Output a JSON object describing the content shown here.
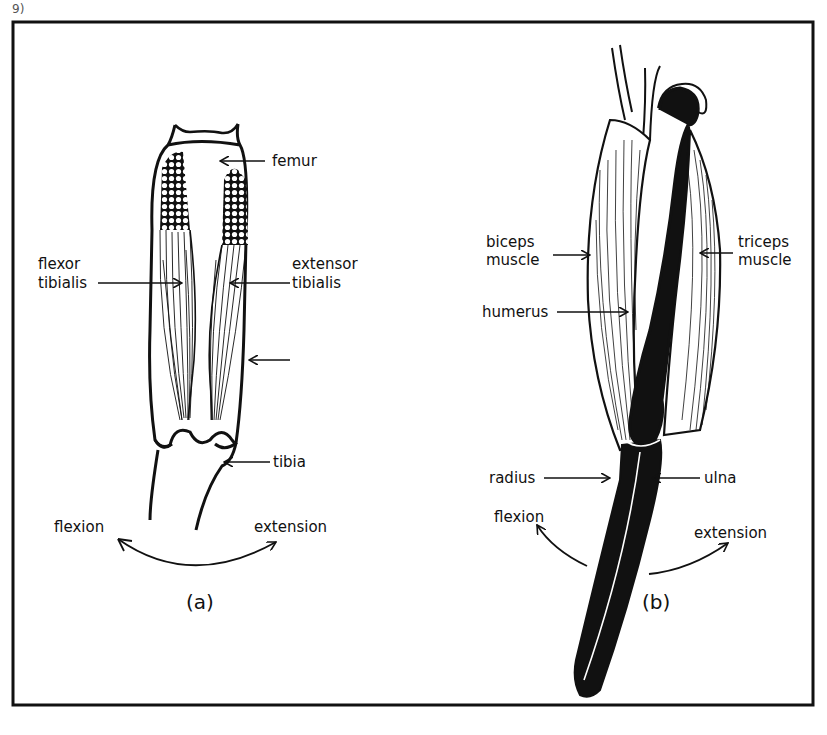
{
  "figure": {
    "corner_mark": "9)",
    "panel_a": {
      "caption": "(a)",
      "labels": {
        "femur": "femur",
        "flexor_line1": "flexor",
        "flexor_line2": "tibialis",
        "extensor_line1": "extensor",
        "extensor_line2": "tibialis",
        "tibia": "tibia",
        "flexion": "flexion",
        "extension": "extension"
      }
    },
    "panel_b": {
      "caption": "(b)",
      "labels": {
        "biceps_line1": "biceps",
        "biceps_line2": "muscle",
        "triceps_line1": "triceps",
        "triceps_line2": "muscle",
        "humerus": "humerus",
        "radius": "radius",
        "ulna": "ulna",
        "flexion": "flexion",
        "extension": "extension"
      }
    },
    "colors": {
      "ink": "#111111",
      "paper": "#ffffff"
    }
  }
}
